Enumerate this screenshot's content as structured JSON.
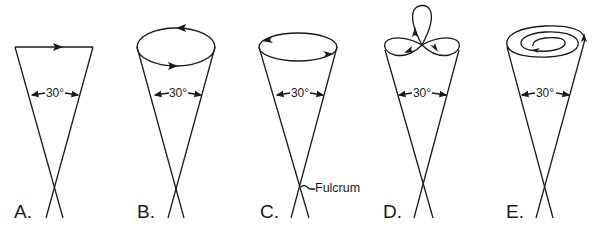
{
  "figure": {
    "panels": [
      {
        "label": "A.",
        "angle": "30°",
        "motion": "straight-line"
      },
      {
        "label": "B.",
        "angle": "30°",
        "motion": "circle"
      },
      {
        "label": "C.",
        "angle": "30°",
        "motion": "circle",
        "annotation": "Fulcrum"
      },
      {
        "label": "D.",
        "angle": "30°",
        "motion": "three-leaf-clover"
      },
      {
        "label": "E.",
        "angle": "30°",
        "motion": "spiral"
      }
    ]
  }
}
